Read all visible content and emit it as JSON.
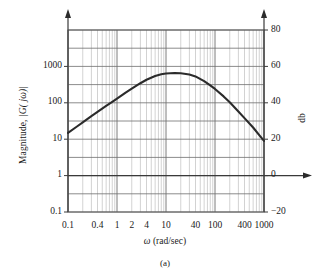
{
  "figure": {
    "caption": "(a)",
    "axis_titles": {
      "x": "ω (rad/sec)",
      "x_symbol": "ω",
      "x_unit": "(rad/sec)",
      "y_left_prefix": "Magnitude, ",
      "y_left_symbol": "|G( jω)|",
      "y_right": "db"
    }
  },
  "chart_data": {
    "type": "line",
    "title": "",
    "subtitle": "",
    "caption": "(a)",
    "xlabel": "ω (rad/sec)",
    "ylabel": "Magnitude, |G( jω)|",
    "ylabel_secondary": "db",
    "xscale": "log",
    "yscale": "log",
    "grid": true,
    "legend": null,
    "xlim": [
      0.1,
      1000
    ],
    "ylim": [
      0.1,
      10000
    ],
    "ylim_db": [
      -20,
      80
    ],
    "xticks": [
      0.1,
      0.4,
      1,
      2,
      4,
      10,
      40,
      100,
      400,
      1000
    ],
    "xticklabels": [
      "0.1",
      "0.4",
      "1",
      "2",
      "4",
      "10",
      "40",
      "100",
      "400",
      "1000"
    ],
    "yticks_left": [
      0.1,
      1,
      10,
      100,
      1000
    ],
    "yticklabels_left": [
      "0.1",
      "1",
      "10",
      "100",
      "1000"
    ],
    "yticks_right": [
      -20,
      0,
      20,
      40,
      60,
      80
    ],
    "yticklabels_right": [
      "−20",
      "0",
      "20",
      "40",
      "60",
      "80"
    ],
    "zero_db_line": {
      "magnitude": 1,
      "db": 0,
      "label": "0 db axis"
    },
    "series": [
      {
        "name": "|G(jω)|",
        "color": "#2b2b2b",
        "x": [
          0.1,
          0.15,
          0.2,
          0.3,
          0.4,
          0.6,
          0.8,
          1,
          1.5,
          2,
          3,
          4,
          6,
          8,
          10,
          15,
          20,
          30,
          40,
          60,
          80,
          100,
          150,
          200,
          300,
          400,
          600,
          800,
          1000
        ],
        "y": [
          15,
          22,
          29,
          43,
          56,
          82,
          106,
          130,
          190,
          245,
          345,
          430,
          545,
          610,
          640,
          660,
          650,
          600,
          530,
          395,
          300,
          240,
          150,
          103,
          58,
          38,
          21,
          13,
          9
        ],
        "y_db": [
          23.5,
          26.8,
          29.3,
          32.7,
          35,
          38.3,
          40.5,
          42.3,
          45.6,
          47.8,
          50.8,
          52.7,
          54.7,
          55.7,
          56.1,
          56.4,
          56.3,
          55.6,
          54.5,
          51.9,
          49.5,
          47.6,
          43.5,
          40.3,
          35.3,
          31.6,
          26.4,
          22.3,
          19.1
        ]
      }
    ],
    "annotations": [
      {
        "text": "peak magnitude ≈ 650 (≈ 56 db) near ω ≈ 20 rad/sec"
      }
    ]
  }
}
